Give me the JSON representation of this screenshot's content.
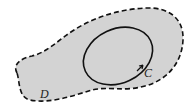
{
  "diagram": {
    "region_label": "D",
    "curve_label": "C",
    "colors": {
      "region_fill": "#d3d3d3",
      "stroke": "#111111",
      "background": "#ffffff"
    }
  }
}
